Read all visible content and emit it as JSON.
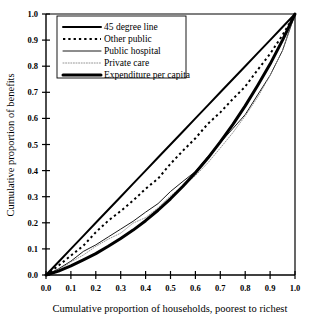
{
  "chart_data": {
    "type": "line",
    "title": "",
    "xlabel": "Cumulative proportion of households, poorest to richest",
    "ylabel": "Cumulative proportion of benefits",
    "xlim": [
      0.0,
      1.0
    ],
    "ylim": [
      0.0,
      1.0
    ],
    "grid": false,
    "legend_position": "top-left",
    "xticks": [
      "0.0",
      "0.1",
      "0.2",
      "0.3",
      "0.4",
      "0.5",
      "0.6",
      "0.7",
      "0.8",
      "0.9",
      "1.0"
    ],
    "yticks": [
      "0.0",
      "0.1",
      "0.2",
      "0.3",
      "0.4",
      "0.5",
      "0.6",
      "0.7",
      "0.8",
      "0.9",
      "1.0"
    ],
    "x": [
      0.0,
      0.05,
      0.1,
      0.15,
      0.2,
      0.25,
      0.3,
      0.35,
      0.4,
      0.45,
      0.5,
      0.55,
      0.6,
      0.65,
      0.7,
      0.75,
      0.8,
      0.85,
      0.9,
      0.95,
      1.0
    ],
    "series": [
      {
        "name": "45 degree line",
        "style": "solid",
        "width": 2.0,
        "color": "#000000",
        "values": [
          0.0,
          0.05,
          0.1,
          0.15,
          0.2,
          0.25,
          0.3,
          0.35,
          0.4,
          0.45,
          0.5,
          0.55,
          0.6,
          0.65,
          0.7,
          0.75,
          0.8,
          0.85,
          0.9,
          0.95,
          1.0
        ]
      },
      {
        "name": "Other public",
        "style": "dotted-thick",
        "width": 2.0,
        "color": "#000000",
        "values": [
          0.0,
          0.035,
          0.075,
          0.115,
          0.16,
          0.205,
          0.245,
          0.285,
          0.33,
          0.375,
          0.425,
          0.475,
          0.525,
          0.575,
          0.625,
          0.675,
          0.725,
          0.78,
          0.845,
          0.915,
          1.0
        ]
      },
      {
        "name": "Public hospital",
        "style": "solid",
        "width": 0.9,
        "color": "#000000",
        "values": [
          0.0,
          0.025,
          0.055,
          0.085,
          0.115,
          0.145,
          0.175,
          0.205,
          0.24,
          0.275,
          0.315,
          0.355,
          0.4,
          0.45,
          0.505,
          0.555,
          0.615,
          0.685,
          0.765,
          0.86,
          1.0
        ]
      },
      {
        "name": "Private care",
        "style": "dotted-fine",
        "width": 0.9,
        "color": "#888888",
        "values": [
          0.0,
          0.02,
          0.045,
          0.075,
          0.105,
          0.135,
          0.165,
          0.195,
          0.225,
          0.26,
          0.3,
          0.34,
          0.385,
          0.435,
          0.49,
          0.545,
          0.61,
          0.685,
          0.77,
          0.865,
          1.0
        ]
      },
      {
        "name": "Expenditure per capita",
        "style": "solid",
        "width": 3.0,
        "color": "#000000",
        "values": [
          0.0,
          0.015,
          0.035,
          0.058,
          0.082,
          0.11,
          0.14,
          0.172,
          0.208,
          0.248,
          0.292,
          0.34,
          0.392,
          0.448,
          0.51,
          0.576,
          0.648,
          0.726,
          0.808,
          0.9,
          1.0
        ]
      }
    ]
  },
  "legend": {
    "entries": [
      {
        "label": "45 degree line"
      },
      {
        "label": "Other public"
      },
      {
        "label": "Public hospital"
      },
      {
        "label": "Private care"
      },
      {
        "label": "Expenditure per capita"
      }
    ]
  }
}
